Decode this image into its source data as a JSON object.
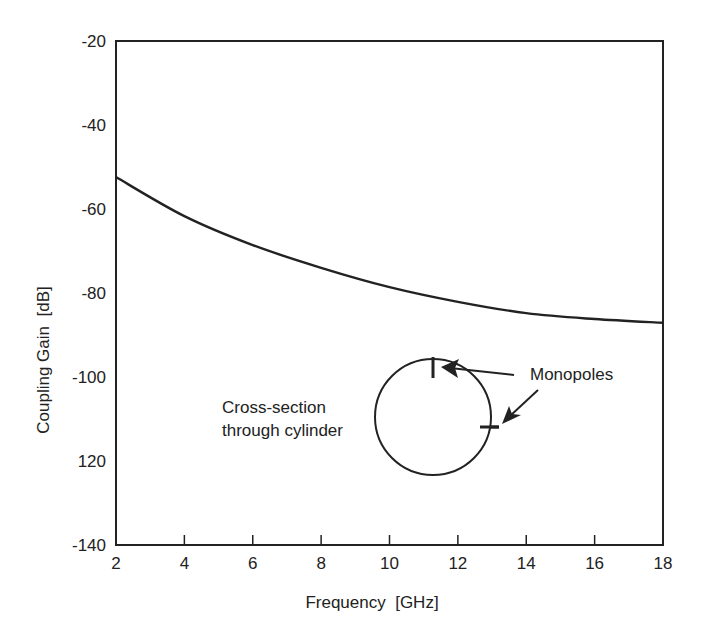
{
  "chart_data": {
    "type": "line",
    "title": "",
    "xlabel": "Frequency  [GHz]",
    "ylabel": "Coupling Gain  [dB]",
    "xlim": [
      2,
      18
    ],
    "ylim": [
      -140,
      -20
    ],
    "grid": false,
    "x_ticks": [
      2,
      4,
      6,
      8,
      10,
      12,
      14,
      16,
      18
    ],
    "x_tick_labels": [
      "2",
      "4",
      "6",
      "8",
      "10",
      "12",
      "14",
      "16",
      "18"
    ],
    "y_ticks": [
      -20,
      -40,
      -60,
      -80,
      -100,
      -120,
      -140
    ],
    "y_tick_labels": [
      "-20",
      "-40",
      "-60",
      "-80",
      "-100",
      "120",
      "-140"
    ],
    "series": [
      {
        "name": "Coupling gain between monopoles",
        "x": [
          2,
          4,
          6,
          8,
          10,
          12,
          14,
          16,
          18
        ],
        "values": [
          -52.4,
          -61.7,
          -68.6,
          -74.0,
          -78.6,
          -82.1,
          -84.8,
          -86.2,
          -87.1
        ]
      }
    ],
    "annotations": [
      {
        "text": "Monopoles",
        "type": "label-with-arrows"
      },
      {
        "text_line1": "Cross-section",
        "text_line2": "through cylinder",
        "type": "inset-diagram"
      }
    ]
  },
  "labels": {
    "xlabel": "Frequency  [GHz]",
    "ylabel": "Coupling Gain  [dB]",
    "monopoles": "Monopoles",
    "cross_section_line1": "Cross-section",
    "cross_section_line2": "through cylinder"
  }
}
